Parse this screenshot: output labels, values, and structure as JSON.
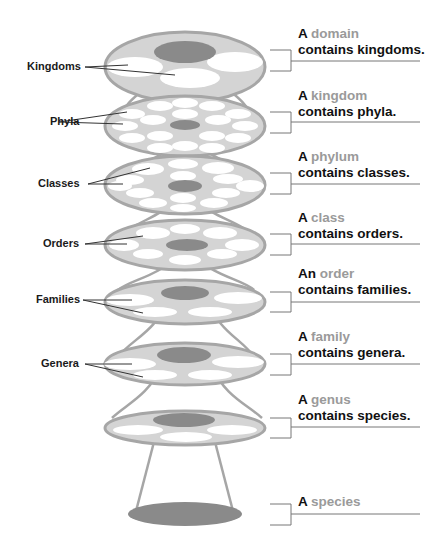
{
  "colors": {
    "disc_fill": "#d4d4d4",
    "disc_rim": "#a6a6a6",
    "hole": "#ffffff",
    "center": "#8a8a8a",
    "term": "#9a9a9a",
    "text": "#111111"
  },
  "levels": [
    {
      "left_label": "Kingdoms",
      "article": "A",
      "term": "domain",
      "rest": "contains kingdoms."
    },
    {
      "left_label": "Phyla",
      "article": "A",
      "term": "kingdom",
      "rest": "contains phyla."
    },
    {
      "left_label": "Classes",
      "article": "A",
      "term": "phylum",
      "rest": "contains classes."
    },
    {
      "left_label": "Orders",
      "article": "A",
      "term": "class",
      "rest": "contains orders."
    },
    {
      "left_label": "Families",
      "article": "An",
      "term": "order",
      "rest": "contains families."
    },
    {
      "left_label": "Genera",
      "article": "A",
      "term": "family",
      "rest": "contains genera."
    },
    {
      "left_label": "",
      "article": "A",
      "term": "genus",
      "rest": "contains species."
    },
    {
      "left_label": "",
      "article": "A",
      "term": "species",
      "rest": ""
    }
  ]
}
